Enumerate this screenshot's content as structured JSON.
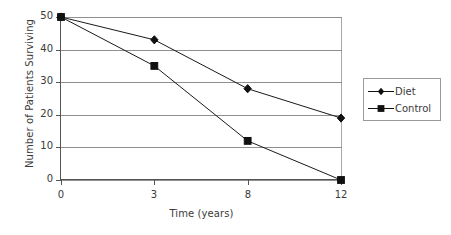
{
  "chart_data": {
    "type": "line",
    "title": "",
    "xlabel": "Time (years)",
    "ylabel": "Number of Patients Surviving",
    "categories": [
      "0",
      "3",
      "8",
      "12"
    ],
    "x": [
      0,
      3,
      8,
      12
    ],
    "xtick_labels": [
      "0",
      "3",
      "8",
      "12"
    ],
    "ytick_labels": [
      "0",
      "10",
      "20",
      "30",
      "40",
      "50"
    ],
    "yticks": [
      0,
      10,
      20,
      30,
      40,
      50
    ],
    "ylim": [
      0,
      50
    ],
    "grid": "horizontal",
    "legend_position": "right",
    "x_scale": "categorical",
    "series": [
      {
        "name": "Diet",
        "marker": "diamond",
        "color": "#111111",
        "values": [
          50,
          43,
          28,
          19
        ]
      },
      {
        "name": "Control",
        "marker": "square",
        "color": "#111111",
        "values": [
          50,
          35,
          12,
          0
        ]
      }
    ]
  },
  "legend": {
    "entries": [
      {
        "label": "Diet",
        "marker": "diamond"
      },
      {
        "label": "Control",
        "marker": "square"
      }
    ]
  },
  "colors": {
    "series": "#111111",
    "gridline": "#8f8f8f",
    "axis": "#555555",
    "frame": "#a8a8a8",
    "text": "#3a3a3a",
    "background": "#ffffff"
  }
}
